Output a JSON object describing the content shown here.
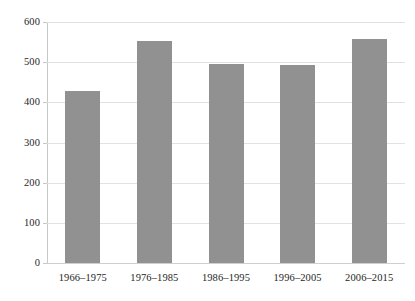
{
  "chart_data": {
    "type": "bar",
    "title": "",
    "subtitle": "",
    "xlabel": "",
    "ylabel": "",
    "categories": [
      "1966–1975",
      "1976–1985",
      "1986–1995",
      "1996–2005",
      "2006–2015"
    ],
    "values": [
      428,
      552,
      495,
      493,
      558
    ],
    "ylim": [
      0,
      600
    ],
    "ytick_labels": [
      "600",
      "500",
      "400",
      "300",
      "200",
      "100",
      "0"
    ],
    "ytick_values": [
      600,
      500,
      400,
      300,
      200,
      100,
      0
    ],
    "grid": true,
    "grid_axis": "y",
    "legend": false,
    "legend_position": "none",
    "series": [
      {
        "name": "",
        "values": [
          428,
          552,
          495,
          493,
          558
        ]
      }
    ],
    "colors": {
      "bar": "#919191",
      "gridline": "#e2e2e2",
      "axis": "#c8c8c8",
      "text": "#1f1f1f",
      "background": "#ffffff"
    }
  }
}
